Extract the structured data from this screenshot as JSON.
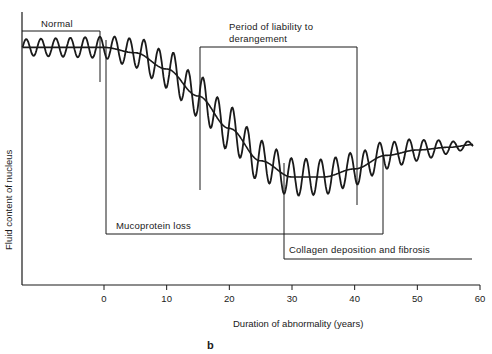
{
  "chart_data": {
    "type": "line",
    "title": "",
    "panel_label": "b",
    "xlabel": "Duration of abnormality (years)",
    "ylabel": "Fluid content of nucleus",
    "xlim": [
      -13,
      60
    ],
    "x_ticks": [
      0,
      10,
      20,
      30,
      40,
      50,
      60
    ],
    "x_tick_labels": [
      "0",
      "10",
      "20",
      "30",
      "40",
      "50",
      "60"
    ],
    "y_ticks": [],
    "grid": false,
    "legend": "none",
    "series": [
      {
        "name": "Mean fluid content (smooth trend)",
        "x": [
          -13,
          -5,
          0,
          5,
          10,
          15,
          20,
          25,
          30,
          35,
          40,
          45,
          50,
          55,
          59
        ],
        "values": [
          0.88,
          0.88,
          0.88,
          0.86,
          0.8,
          0.7,
          0.58,
          0.46,
          0.4,
          0.4,
          0.43,
          0.48,
          0.5,
          0.51,
          0.52
        ]
      },
      {
        "name": "Fluctuating fluid content (oscillating)",
        "description": "Oscillates around the smooth trend; small amplitude in the normal period, large amplitude during decline (~5–40 yrs), damping toward 60 yrs",
        "amplitude_by_x": {
          "-13": 0.03,
          "0": 0.04,
          "10": 0.07,
          "20": 0.08,
          "30": 0.07,
          "40": 0.06,
          "50": 0.04,
          "59": 0.01
        }
      }
    ],
    "annotations": [
      {
        "text": "Normal",
        "type": "bracket",
        "x_start": -13,
        "x_end": -0.5
      },
      {
        "text": "Mucoprotein loss",
        "type": "bracket",
        "x_start": 0.5,
        "x_end": 44.5
      },
      {
        "text": "Period of liability to derangement",
        "type": "bracket",
        "x_start": 15,
        "x_end": 40.5
      },
      {
        "text": "Collagen deposition and fibrosis",
        "type": "bracket",
        "x_start": 28.5,
        "x_end": 59
      }
    ]
  },
  "labels": {
    "normal": "Normal",
    "liability_line1": "Period of liability to",
    "liability_line2": "derangement",
    "mucoprotein": "Mucoprotein loss",
    "collagen": "Collagen deposition and fibrosis",
    "xlabel": "Duration of abnormality (years)",
    "ylabel": "Fluid content of nucleus",
    "panel": "b",
    "ticks": [
      "0",
      "10",
      "20",
      "30",
      "40",
      "50",
      "60"
    ]
  },
  "colors": {
    "ink": "#1a1a1a",
    "background": "#ffffff"
  }
}
